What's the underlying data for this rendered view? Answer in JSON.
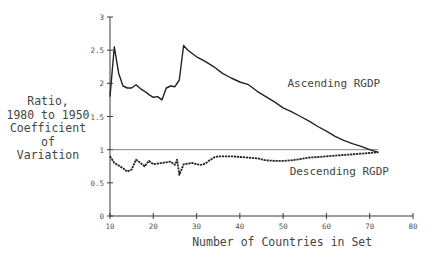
{
  "chart_data": {
    "type": "line",
    "title": "",
    "xlabel": "Number of Countries in Set",
    "ylabel": [
      "Ratio,",
      "1980 to 1950",
      "Coefficient",
      "of",
      "Variation"
    ],
    "xlim": [
      10,
      80
    ],
    "ylim": [
      0,
      3
    ],
    "x_ticks": [
      10,
      20,
      30,
      40,
      50,
      60,
      70,
      80
    ],
    "y_ticks": [
      0,
      0.5,
      1,
      1.5,
      2,
      2.5,
      3
    ],
    "y_tick_labels": [
      "0",
      "0.5",
      "1",
      "1.5",
      "2",
      "2.5",
      "3"
    ],
    "grid": false,
    "reference_line": {
      "y": 1,
      "x_range": [
        10,
        72
      ]
    },
    "series": [
      {
        "name": "Ascending RGDP",
        "style": "solid",
        "label_position": {
          "x": 51,
          "y": 1.95
        },
        "x": [
          10,
          11,
          12,
          13,
          14,
          15,
          16,
          17,
          18,
          19,
          20,
          21,
          22,
          23,
          24,
          25,
          26,
          27,
          28,
          30,
          32,
          34,
          36,
          38,
          40,
          42,
          44,
          46,
          48,
          50,
          52,
          54,
          56,
          58,
          60,
          62,
          64,
          66,
          68,
          70,
          72
        ],
        "y": [
          1.8,
          2.55,
          2.15,
          1.96,
          1.93,
          1.93,
          1.98,
          1.92,
          1.88,
          1.83,
          1.79,
          1.8,
          1.75,
          1.93,
          1.96,
          1.95,
          2.05,
          2.57,
          2.5,
          2.4,
          2.33,
          2.25,
          2.15,
          2.08,
          2.02,
          1.98,
          1.88,
          1.8,
          1.72,
          1.63,
          1.57,
          1.5,
          1.43,
          1.35,
          1.28,
          1.2,
          1.14,
          1.09,
          1.05,
          1.0,
          0.96
        ]
      },
      {
        "name": "Descending RGDP",
        "style": "dotted",
        "label_position": {
          "x": 51.5,
          "y": 0.62
        },
        "x": [
          10,
          11,
          12,
          13,
          14,
          15,
          16,
          17,
          18,
          19,
          20,
          21,
          22,
          23,
          24,
          25,
          25.5,
          26,
          27,
          28,
          29,
          30,
          31,
          32,
          33,
          34,
          35,
          38,
          40,
          42,
          44,
          46,
          48,
          50,
          52,
          54,
          56,
          58,
          60,
          62,
          64,
          66,
          68,
          70,
          72
        ],
        "y": [
          0.9,
          0.8,
          0.76,
          0.72,
          0.67,
          0.7,
          0.85,
          0.8,
          0.75,
          0.83,
          0.78,
          0.79,
          0.8,
          0.81,
          0.82,
          0.77,
          0.85,
          0.62,
          0.78,
          0.79,
          0.8,
          0.78,
          0.77,
          0.79,
          0.84,
          0.88,
          0.9,
          0.9,
          0.89,
          0.88,
          0.87,
          0.84,
          0.83,
          0.83,
          0.84,
          0.86,
          0.88,
          0.89,
          0.9,
          0.91,
          0.92,
          0.93,
          0.94,
          0.95,
          0.96
        ]
      }
    ]
  }
}
